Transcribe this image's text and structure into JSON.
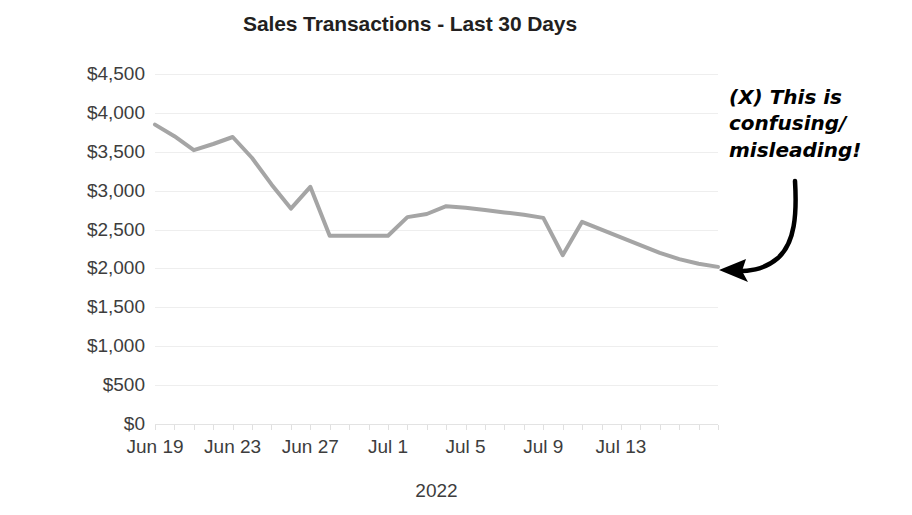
{
  "chart_data": {
    "type": "line",
    "title": "Sales Transactions - Last 30 Days",
    "xlabel": "2022",
    "ylabel": "",
    "ylim": [
      0,
      4500
    ],
    "grid": true,
    "legend": "none",
    "y_ticks": [
      "$4,500",
      "$4,000",
      "$3,500",
      "$3,000",
      "$2,500",
      "$2,000",
      "$1,500",
      "$1,000",
      "$500",
      "$0"
    ],
    "y_tick_values": [
      4500,
      4000,
      3500,
      3000,
      2500,
      2000,
      1500,
      1000,
      500,
      0
    ],
    "x_ticks": [
      "Jun 19",
      "Jun 23",
      "Jun 27",
      "Jul 1",
      "Jul 5",
      "Jul 9",
      "Jul 13"
    ],
    "x_tick_values": [
      0,
      4,
      8,
      12,
      16,
      20,
      24
    ],
    "x": [
      0,
      1,
      2,
      3,
      4,
      5,
      6,
      7,
      8,
      9,
      10,
      11,
      12,
      13,
      14,
      15,
      16,
      17,
      18,
      19,
      20,
      21,
      22,
      23,
      24,
      25,
      26,
      27,
      28,
      29
    ],
    "categories": [
      "Jun 19",
      "Jun 20",
      "Jun 21",
      "Jun 22",
      "Jun 23",
      "Jun 24",
      "Jun 25",
      "Jun 26",
      "Jun 27",
      "Jun 28",
      "Jun 29",
      "Jun 30",
      "Jul 1",
      "Jul 2",
      "Jul 3",
      "Jul 4",
      "Jul 5",
      "Jul 6",
      "Jul 7",
      "Jul 8",
      "Jul 9",
      "Jul 10",
      "Jul 11",
      "Jul 12",
      "Jul 13",
      "Jul 14",
      "Jul 15",
      "Jul 16",
      "Jul 17",
      "Jul 18"
    ],
    "values": [
      3850,
      3700,
      3520,
      3600,
      3690,
      3420,
      3080,
      2770,
      3050,
      2420,
      2420,
      2420,
      2420,
      2660,
      2700,
      2800,
      2780,
      2750,
      2720,
      2690,
      2650,
      2170,
      2600,
      2500,
      2400,
      2300,
      2200,
      2120,
      2060,
      2020
    ],
    "line_color": "#a5a5a5",
    "line_width": 4,
    "gridline_color": "#eeeeee",
    "text_color": "#3d3d3d"
  },
  "annotation": {
    "text": "(X) This is confusing/ misleading!",
    "arrow_color": "#000000",
    "arrow_target": "end of line"
  }
}
